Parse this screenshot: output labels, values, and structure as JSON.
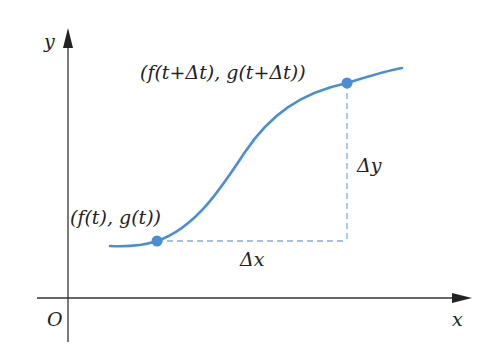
{
  "diagram": {
    "axes": {
      "x_label": "x",
      "y_label": "y",
      "origin_label": "O",
      "color": "#333333"
    },
    "curve": {
      "color": "#4a8fd4",
      "description": "parametric curve (f(t), g(t))"
    },
    "points": [
      {
        "label": "(f(t), g(t))",
        "x": 157,
        "y": 241
      },
      {
        "label": "(f(t+Δt), g(t+Δt))",
        "x": 347,
        "y": 83
      }
    ],
    "increments": {
      "dx_label": "Δx",
      "dy_label": "Δy",
      "dash_color": "#7fb0e0"
    }
  }
}
